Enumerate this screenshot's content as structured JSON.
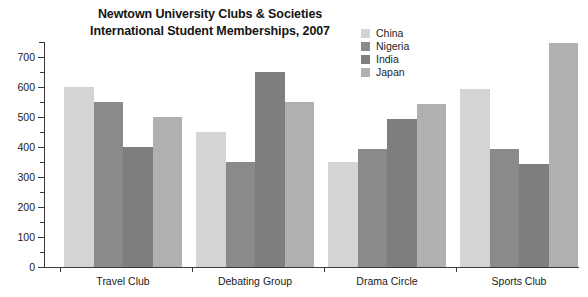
{
  "chart_data": {
    "type": "bar",
    "title": "Newtown University Clubs & Societies International Student Memberships, 2007",
    "title_line1": "Newtown University Clubs & Societies",
    "title_line2": "International Student Memberships, 2007",
    "xlabel": "",
    "ylabel": "",
    "ylim": [
      0,
      750
    ],
    "grid": false,
    "legend_position": "top-right",
    "categories": [
      "Travel Club",
      "Debating Group",
      "Drama Circle",
      "Sports Club"
    ],
    "y_tick_labels": [
      "0",
      "100",
      "200",
      "300",
      "400",
      "500",
      "600",
      "700"
    ],
    "y_ticks_major": [
      0,
      100,
      200,
      300,
      400,
      500,
      600,
      700
    ],
    "y_ticks_minor": [
      50,
      150,
      250,
      350,
      450,
      550,
      650,
      750
    ],
    "series": [
      {
        "name": "China",
        "color": "#d4d4d4",
        "values": [
          600,
          450,
          350,
          595
        ]
      },
      {
        "name": "Nigeria",
        "color": "#8a8a8a",
        "values": [
          550,
          350,
          395,
          393
        ]
      },
      {
        "name": "India",
        "color": "#7e7e7e",
        "values": [
          400,
          650,
          495,
          345
        ]
      },
      {
        "name": "Japan",
        "color": "#b0b0b0",
        "values": [
          500,
          550,
          545,
          748
        ]
      }
    ]
  }
}
